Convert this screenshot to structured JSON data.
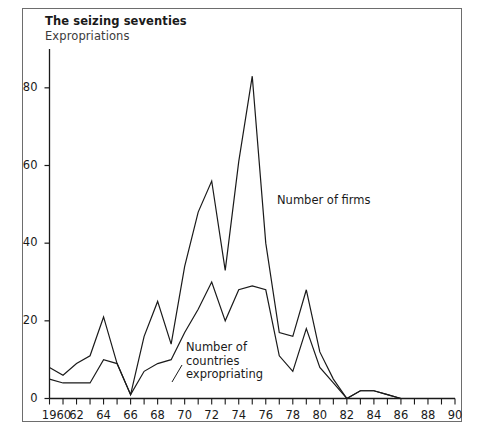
{
  "figure": {
    "title": "The seizing seventies",
    "subtitle": "Expropriations"
  },
  "chart_data": {
    "type": "line",
    "title": "The seizing seventies",
    "subtitle": "Expropriations",
    "xlabel": "",
    "ylabel": "",
    "xlim": [
      1960,
      1990
    ],
    "ylim": [
      0,
      90
    ],
    "grid": false,
    "legend_position": "inline-annotations",
    "yticks": [
      0,
      20,
      40,
      60,
      80
    ],
    "ytick_labels": [
      "0",
      "20",
      "40",
      "60",
      "80"
    ],
    "xticks": [
      1960,
      1962,
      1964,
      1966,
      1968,
      1970,
      1972,
      1974,
      1976,
      1978,
      1980,
      1982,
      1984,
      1986,
      1988,
      1990
    ],
    "xtick_labels": [
      "1960",
      "62",
      "64",
      "66",
      "68",
      "70",
      "72",
      "74",
      "76",
      "78",
      "80",
      "82",
      "84",
      "86",
      "88",
      "90"
    ],
    "xtick_minor_every": 1,
    "x": [
      1960,
      1961,
      1962,
      1963,
      1964,
      1965,
      1966,
      1967,
      1968,
      1969,
      1970,
      1971,
      1972,
      1973,
      1974,
      1975,
      1976,
      1977,
      1978,
      1979,
      1980,
      1981,
      1982,
      1983,
      1984,
      1985,
      1986,
      1987,
      1988,
      1989,
      1990
    ],
    "series": [
      {
        "name": "Number of firms",
        "color": "#1a1a1a",
        "values": [
          8,
          6,
          9,
          11,
          21,
          9,
          1,
          16,
          25,
          14,
          34,
          48,
          56,
          33,
          61,
          83,
          40,
          17,
          16,
          28,
          12,
          5,
          0,
          2,
          2,
          1,
          0,
          0,
          0,
          0,
          0
        ]
      },
      {
        "name": "Number of countries expropriating",
        "color": "#1a1a1a",
        "values": [
          5,
          4,
          4,
          4,
          10,
          9,
          1,
          7,
          9,
          10,
          17,
          23,
          30,
          20,
          28,
          29,
          28,
          11,
          7,
          18,
          8,
          4,
          0,
          2,
          2,
          1,
          0,
          0,
          0,
          0,
          0
        ]
      }
    ],
    "annotations": [
      {
        "name": "firms-annotation",
        "text": "Number of firms",
        "lines": [
          "Number of firms"
        ],
        "x": 1978.0,
        "y": 58
      },
      {
        "name": "countries-annotation",
        "text": "Number of countries expropriating",
        "lines": [
          "Number of",
          "countries",
          "expropriating"
        ],
        "x": 1969.5,
        "y": 15
      }
    ]
  }
}
